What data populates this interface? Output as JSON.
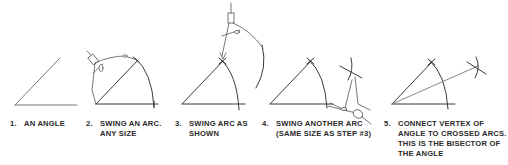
{
  "steps": [
    {
      "number": "1.",
      "lines": [
        "AN ANGLE"
      ]
    },
    {
      "number": "2.",
      "lines": [
        "SWING AN ARC.",
        "ANY SIZE"
      ]
    },
    {
      "number": "3.",
      "lines": [
        "SWING ARC AS",
        "SHOWN"
      ]
    },
    {
      "number": "4.",
      "lines": [
        "SWING ANOTHER ARC",
        "(SAME SIZE AS STEP #3)"
      ]
    },
    {
      "number": "5.",
      "lines": [
        "CONNECT VERTEX OF",
        "ANGLE TO CROSSED ARCS.",
        "THIS IS THE BISECTOR OF",
        "THE ANGLE"
      ]
    }
  ],
  "colors": {
    "ink": "#333333",
    "light_ink": "#8a8a8a",
    "background": "#ffffff"
  }
}
